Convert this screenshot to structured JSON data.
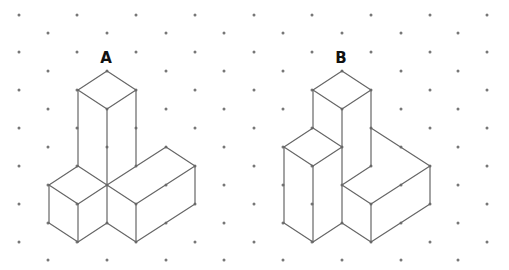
{
  "diagram": {
    "type": "isometric dot grid with two block figures",
    "colors": {
      "background": "#ffffff",
      "dot": "#777777",
      "edge": "#666666",
      "label": "#111111"
    },
    "grid": {
      "even_rows_y": [
        15,
        52,
        90,
        128,
        166,
        204,
        242
      ],
      "odd_rows_y": [
        33,
        71,
        109,
        147,
        185,
        223,
        260
      ],
      "even_cols_x": [
        19,
        77,
        136,
        195,
        254,
        312,
        371,
        430,
        487
      ],
      "odd_cols_x": [
        48,
        107,
        166,
        224,
        283,
        342,
        401,
        458
      ]
    },
    "figures": [
      {
        "label": "A",
        "label_pos": [
          106,
          58
        ],
        "edges": [
          [
            [
              107,
              71
            ],
            [
              78,
              90
            ]
          ],
          [
            [
              107,
              71
            ],
            [
              136,
              90
            ]
          ],
          [
            [
              78,
              90
            ],
            [
              107,
              109
            ]
          ],
          [
            [
              136,
              90
            ],
            [
              107,
              109
            ]
          ],
          [
            [
              78,
              90
            ],
            [
              78,
              166
            ]
          ],
          [
            [
              136,
              90
            ],
            [
              136,
              166
            ]
          ],
          [
            [
              107,
              109
            ],
            [
              107,
              185
            ]
          ],
          [
            [
              78,
              166
            ],
            [
              49,
              185
            ]
          ],
          [
            [
              49,
              185
            ],
            [
              78,
              204
            ]
          ],
          [
            [
              78,
              204
            ],
            [
              107,
              185
            ]
          ],
          [
            [
              78,
              166
            ],
            [
              107,
              185
            ]
          ],
          [
            [
              49,
              185
            ],
            [
              49,
              223
            ]
          ],
          [
            [
              78,
              204
            ],
            [
              78,
              242
            ]
          ],
          [
            [
              49,
              223
            ],
            [
              78,
              242
            ]
          ],
          [
            [
              78,
              242
            ],
            [
              107,
              223
            ]
          ],
          [
            [
              107,
              185
            ],
            [
              107,
              223
            ]
          ],
          [
            [
              107,
              185
            ],
            [
              166,
              147
            ]
          ],
          [
            [
              166,
              147
            ],
            [
              195,
              166
            ]
          ],
          [
            [
              195,
              166
            ],
            [
              136,
              204
            ]
          ],
          [
            [
              136,
              204
            ],
            [
              107,
              185
            ]
          ],
          [
            [
              136,
              204
            ],
            [
              136,
              242
            ]
          ],
          [
            [
              195,
              166
            ],
            [
              195,
              204
            ]
          ],
          [
            [
              136,
              242
            ],
            [
              195,
              204
            ]
          ],
          [
            [
              107,
              223
            ],
            [
              136,
              242
            ]
          ]
        ]
      },
      {
        "label": "B",
        "label_pos": [
          341,
          58
        ],
        "edges": [
          [
            [
              342,
              71
            ],
            [
              313,
              90
            ]
          ],
          [
            [
              342,
              71
            ],
            [
              371,
              90
            ]
          ],
          [
            [
              313,
              90
            ],
            [
              342,
              109
            ]
          ],
          [
            [
              371,
              90
            ],
            [
              342,
              109
            ]
          ],
          [
            [
              313,
              90
            ],
            [
              313,
              128
            ]
          ],
          [
            [
              342,
              109
            ],
            [
              342,
              147
            ]
          ],
          [
            [
              371,
              90
            ],
            [
              371,
              166
            ]
          ],
          [
            [
              313,
              128
            ],
            [
              284,
              147
            ]
          ],
          [
            [
              284,
              147
            ],
            [
              313,
              166
            ]
          ],
          [
            [
              313,
              166
            ],
            [
              342,
              147
            ]
          ],
          [
            [
              313,
              128
            ],
            [
              342,
              147
            ]
          ],
          [
            [
              284,
              147
            ],
            [
              284,
              223
            ]
          ],
          [
            [
              313,
              166
            ],
            [
              313,
              242
            ]
          ],
          [
            [
              342,
              147
            ],
            [
              342,
              223
            ]
          ],
          [
            [
              284,
              223
            ],
            [
              313,
              242
            ]
          ],
          [
            [
              313,
              242
            ],
            [
              342,
              223
            ]
          ],
          [
            [
              371,
              128
            ],
            [
              430,
              166
            ]
          ],
          [
            [
              371,
              166
            ],
            [
              342,
              185
            ]
          ],
          [
            [
              342,
              185
            ],
            [
              371,
              204
            ]
          ],
          [
            [
              371,
              204
            ],
            [
              430,
              166
            ]
          ],
          [
            [
              371,
              204
            ],
            [
              371,
              242
            ]
          ],
          [
            [
              430,
              166
            ],
            [
              430,
              204
            ]
          ],
          [
            [
              371,
              242
            ],
            [
              430,
              204
            ]
          ],
          [
            [
              342,
              223
            ],
            [
              371,
              242
            ]
          ]
        ]
      }
    ]
  }
}
